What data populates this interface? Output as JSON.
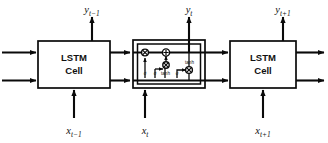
{
  "diagram": {
    "type": "lstm-unrolled-chain",
    "background_color": "#ffffff",
    "line_color": "#0a0a0a"
  },
  "cells": [
    {
      "id": "cell-prev",
      "label_line1": "LSTM",
      "label_line2": "Cell",
      "input_label": "x",
      "input_subscript": "t−1",
      "output_label": "y",
      "output_subscript": "t−1",
      "expanded": false
    },
    {
      "id": "cell-current",
      "label_line1": "LSTM",
      "label_line2": "Cell",
      "input_label": "x",
      "input_subscript": "t",
      "output_label": "y",
      "output_subscript": "t",
      "expanded": true
    },
    {
      "id": "cell-next",
      "label_line1": "LSTM",
      "label_line2": "Cell",
      "input_label": "x",
      "input_subscript": "t+1",
      "output_label": "y",
      "output_subscript": "t+1",
      "expanded": false
    }
  ],
  "internals": {
    "gates": [
      {
        "id": "forget-gate",
        "label": "σ",
        "name": "forget-gate-sigmoid"
      },
      {
        "id": "input-gate",
        "label": "σ",
        "name": "input-gate-sigmoid"
      },
      {
        "id": "candidate-gate",
        "label": "tanh",
        "name": "candidate-tanh"
      },
      {
        "id": "output-gate",
        "label": "σ",
        "name": "output-gate-sigmoid"
      }
    ],
    "operators": [
      {
        "id": "op-forget-mult",
        "glyph": "×",
        "name": "forget-multiply"
      },
      {
        "id": "op-state-add",
        "glyph": "+",
        "name": "cell-state-add"
      },
      {
        "id": "op-input-mult",
        "glyph": "×",
        "name": "input-multiply"
      },
      {
        "id": "op-output-mult",
        "glyph": "×",
        "name": "output-multiply"
      }
    ],
    "activation": {
      "id": "state-tanh",
      "label": "tanh",
      "name": "cell-state-tanh"
    }
  }
}
